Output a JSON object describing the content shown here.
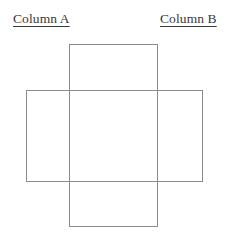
{
  "canvas": {
    "width": 228,
    "height": 237,
    "background_color": "#ffffff"
  },
  "labels": {
    "column_a": "Column A",
    "column_b": "Column B"
  },
  "chart_data": {
    "type": "diagram",
    "title": "",
    "grid": false,
    "legend": null,
    "stroke_color": "#8b8b8b",
    "stroke_width": 1,
    "fill": "none",
    "shapes": [
      {
        "name": "vertical-rectangle",
        "label": "Column A figure",
        "x": 69,
        "y": 44,
        "width": 88,
        "height": 182
      },
      {
        "name": "horizontal-rectangle",
        "label": "Column B figure",
        "x": 26,
        "y": 90,
        "width": 176,
        "height": 91
      }
    ],
    "annotations": [
      {
        "text": "Column A",
        "x": 13,
        "y": 11,
        "underline": true
      },
      {
        "text": "Column B",
        "x": 160,
        "y": 11,
        "underline": true
      }
    ]
  }
}
